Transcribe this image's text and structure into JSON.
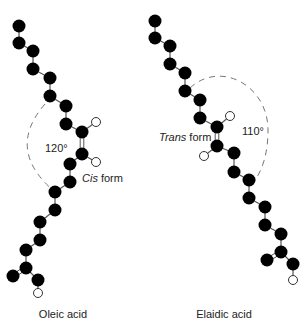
{
  "figure": {
    "molecules": [
      {
        "name": "Oleic acid",
        "form_italic": "Cis",
        "form_rest": " form",
        "angle": "120°",
        "carbons": [
          [
            19,
            26
          ],
          [
            19,
            43
          ],
          [
            33,
            51
          ],
          [
            33,
            69
          ],
          [
            50,
            78
          ],
          [
            50,
            96
          ],
          [
            66,
            106
          ],
          [
            66,
            124
          ],
          [
            82,
            132
          ],
          [
            82,
            154
          ],
          [
            70,
            164
          ],
          [
            70,
            182
          ],
          [
            55,
            192
          ],
          [
            55,
            210
          ],
          [
            40,
            222
          ],
          [
            40,
            240
          ],
          [
            26,
            250
          ],
          [
            26,
            268
          ],
          [
            13,
            276
          ],
          [
            38,
            280
          ]
        ],
        "double_bond": [
          8,
          9
        ],
        "carboxyl_double": [
          17,
          18
        ],
        "hydrogens": [
          {
            "atom": 8,
            "pos": [
              96,
              122
            ]
          },
          {
            "atom": 9,
            "pos": [
              96,
              162
            ]
          },
          {
            "atom": 19,
            "pos": [
              38,
              293
            ]
          }
        ],
        "arc": "M 45 104 Q 5 150 55 192"
      },
      {
        "name": "Elaidic acid",
        "form_italic": "Trans",
        "form_rest": " form",
        "angle": "110°",
        "carbons": [
          [
            155,
            21
          ],
          [
            155,
            38
          ],
          [
            170,
            46
          ],
          [
            170,
            64
          ],
          [
            185,
            73
          ],
          [
            185,
            91
          ],
          [
            200,
            100
          ],
          [
            200,
            118
          ],
          [
            217,
            127
          ],
          [
            217,
            146
          ],
          [
            234,
            153
          ],
          [
            234,
            172
          ],
          [
            249,
            180
          ],
          [
            249,
            198
          ],
          [
            265,
            207
          ],
          [
            265,
            225
          ],
          [
            281,
            234
          ],
          [
            281,
            252
          ],
          [
            267,
            260
          ],
          [
            293,
            264
          ]
        ],
        "double_bond": [
          8,
          9
        ],
        "carboxyl_double": [
          17,
          18
        ],
        "hydrogens": [
          {
            "atom": 8,
            "pos": [
              230,
              116
            ]
          },
          {
            "atom": 9,
            "pos": [
              204,
              156
            ]
          },
          {
            "atom": 19,
            "pos": [
              293,
              280
            ]
          }
        ],
        "arc": "M 190 88 C 220 60 268 85 268 130 C 268 155 262 170 254 182"
      }
    ],
    "colors": {
      "atom": "#000000",
      "bond": "#555555",
      "arc": "#777777"
    }
  }
}
